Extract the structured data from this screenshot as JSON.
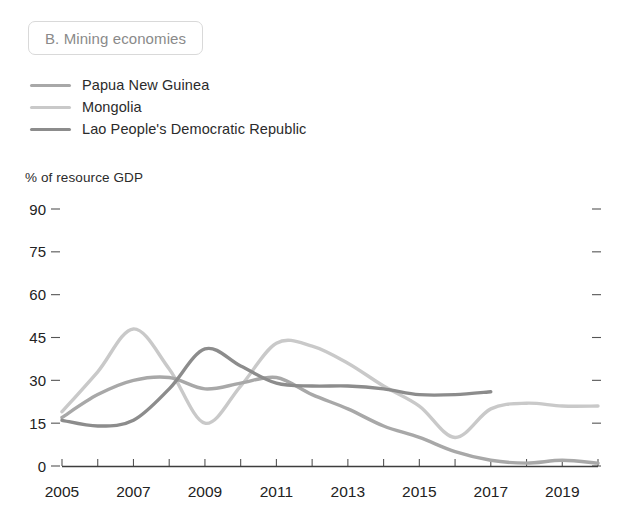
{
  "panel": {
    "title": "B. Mining economies"
  },
  "legend": {
    "position": "top-left",
    "items": [
      {
        "label": "Papua New Guinea",
        "color": "#a8a8a8",
        "swatch_icon": "line-swatch-icon"
      },
      {
        "label": "Mongolia",
        "color": "#c9c9c9",
        "swatch_icon": "line-swatch-icon"
      },
      {
        "label": "Lao People's Democratic Republic",
        "color": "#8c8c8c",
        "swatch_icon": "line-swatch-icon"
      }
    ]
  },
  "axes": {
    "y_caption": "% of resource GDP",
    "y_ticks": [
      "0",
      "15",
      "30",
      "45",
      "60",
      "75",
      "90"
    ],
    "x_ticks": [
      "2005",
      "2007",
      "2009",
      "2011",
      "2013",
      "2015",
      "2017",
      "2019"
    ]
  },
  "chart_data": {
    "type": "line",
    "title": "B. Mining economies",
    "xlabel": "",
    "ylabel": "% of resource GDP",
    "ylim": [
      0,
      90
    ],
    "xlim": [
      2005,
      2020
    ],
    "grid": false,
    "legend_position": "top-left",
    "y_tick_values": [
      0,
      15,
      30,
      45,
      60,
      75,
      90
    ],
    "x_tick_values": [
      2005,
      2006,
      2007,
      2008,
      2009,
      2010,
      2011,
      2012,
      2013,
      2014,
      2015,
      2016,
      2017,
      2018,
      2019,
      2020
    ],
    "x_tick_labels_shown": [
      2005,
      2007,
      2009,
      2011,
      2013,
      2015,
      2017,
      2019
    ],
    "series": [
      {
        "name": "Papua New Guinea",
        "color": "#a8a8a8",
        "x": [
          2005,
          2006,
          2007,
          2008,
          2009,
          2010,
          2011,
          2012,
          2013,
          2014,
          2015,
          2016,
          2017,
          2018,
          2019,
          2020
        ],
        "values": [
          17,
          25,
          30,
          31,
          27,
          29,
          31,
          25,
          20,
          14,
          10,
          5,
          2,
          1,
          2,
          1
        ]
      },
      {
        "name": "Mongolia",
        "color": "#c9c9c9",
        "x": [
          2005,
          2006,
          2007,
          2008,
          2009,
          2010,
          2011,
          2012,
          2013,
          2014,
          2015,
          2016,
          2017,
          2018,
          2019,
          2020
        ],
        "values": [
          19,
          33,
          48,
          34,
          15,
          28,
          43,
          42,
          36,
          28,
          21,
          10,
          20,
          22,
          21,
          21
        ]
      },
      {
        "name": "Lao People's Democratic Republic",
        "color": "#8c8c8c",
        "x": [
          2005,
          2006,
          2007,
          2008,
          2009,
          2010,
          2011,
          2012,
          2013,
          2014,
          2015,
          2016,
          2017
        ],
        "values": [
          16,
          14,
          16,
          27,
          41,
          35,
          29,
          28,
          28,
          27,
          25,
          25,
          26
        ]
      }
    ]
  }
}
